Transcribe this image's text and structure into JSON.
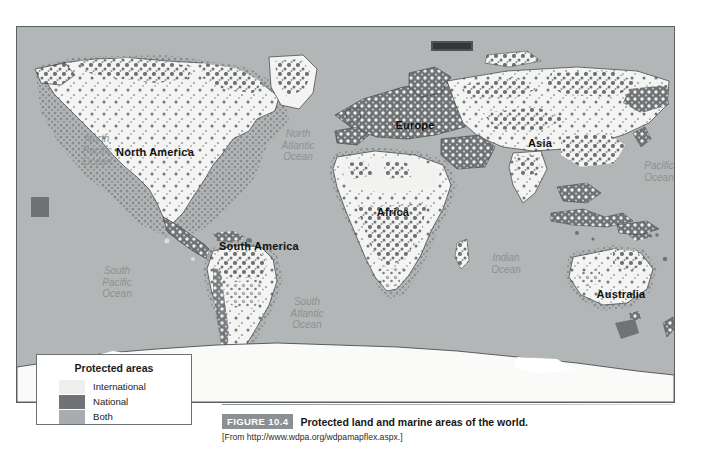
{
  "figure": {
    "tag": "FIGURE 10.4",
    "caption": "Protected land and marine areas of the world.",
    "source": "[From http://www.wdpa.org/wdpamapflex.aspx.]"
  },
  "legend": {
    "title": "Protected areas",
    "items": [
      {
        "label": "International",
        "color": "#eeeeec"
      },
      {
        "label": "National",
        "color": "#6f7376"
      },
      {
        "label": "Both",
        "color": "#a9acae"
      }
    ]
  },
  "map": {
    "ocean_color": "#b3b6b6",
    "land_color": "#f4f4f2",
    "coastline_color": "#3a3d3f",
    "continent_labels": [
      {
        "name": "north-america",
        "text": "North America",
        "x": 138,
        "y": 126
      },
      {
        "name": "south-america",
        "text": "South America",
        "x": 235,
        "y": 226
      },
      {
        "name": "europe",
        "text": "Europe",
        "x": 398,
        "y": 99
      },
      {
        "name": "africa",
        "text": "Africa",
        "x": 376,
        "y": 186
      },
      {
        "name": "asia",
        "text": "Asia",
        "x": 523,
        "y": 117
      },
      {
        "name": "australia",
        "text": "Australia",
        "x": 604,
        "y": 268
      },
      {
        "name": "antarctica",
        "text": "Antarctica",
        "x": 368,
        "y": 389
      }
    ],
    "ocean_labels": [
      {
        "name": "north-pacific-ocean",
        "text": "North\nPacific\nOcean",
        "x": 80,
        "y": 124
      },
      {
        "name": "north-atlantic-ocean",
        "text": "North\nAtlantic\nOcean",
        "x": 281,
        "y": 119
      },
      {
        "name": "south-pacific-ocean",
        "text": "South\nPacific\nOcean",
        "x": 100,
        "y": 256
      },
      {
        "name": "south-atlantic-ocean",
        "text": "South\nAtlantic\nOcean",
        "x": 290,
        "y": 287
      },
      {
        "name": "indian-ocean",
        "text": "Indian\nOcean",
        "x": 489,
        "y": 237
      },
      {
        "name": "pacific-ocean",
        "text": "Pacific\nOcean",
        "x": 642,
        "y": 145
      }
    ]
  }
}
